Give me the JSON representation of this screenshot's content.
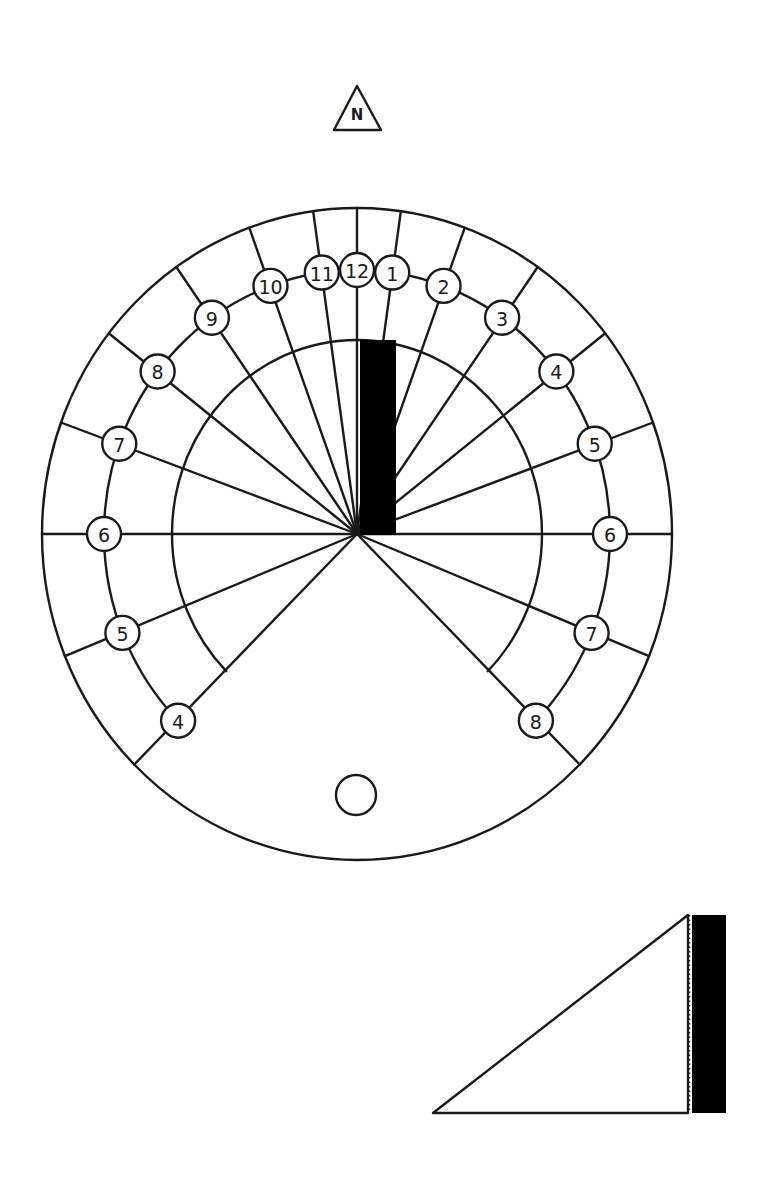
{
  "north_marker": {
    "label": "N",
    "icon": "north-triangle-icon"
  },
  "dial": {
    "center": [
      357,
      534
    ],
    "outer_radius": [
      315,
      326
    ],
    "hour_ring_radius": [
      253,
      264
    ],
    "inner_arc_radius": [
      185,
      194
    ],
    "gnomon_color": "#000000",
    "line_color": "#1a1a1a",
    "hours": [
      {
        "label": "4",
        "angle": -135
      },
      {
        "label": "5",
        "angle": -112
      },
      {
        "label": "6",
        "angle": -90
      },
      {
        "label": "7",
        "angle": -70
      },
      {
        "label": "8",
        "angle": -52
      },
      {
        "label": "9",
        "angle": -35
      },
      {
        "label": "10",
        "angle": -20
      },
      {
        "label": "11",
        "angle": -8
      },
      {
        "label": "12",
        "angle": 0
      },
      {
        "label": "1",
        "angle": 8
      },
      {
        "label": "2",
        "angle": 20
      },
      {
        "label": "3",
        "angle": 35
      },
      {
        "label": "4",
        "angle": 52
      },
      {
        "label": "5",
        "angle": 70
      },
      {
        "label": "6",
        "angle": 90
      },
      {
        "label": "7",
        "angle": 112
      },
      {
        "label": "8",
        "angle": 135
      }
    ],
    "mounting_hole": {
      "center": [
        356,
        795
      ],
      "radius": 20
    }
  },
  "gnomon_side_view": {
    "shape": "right-triangle",
    "points": [
      [
        433,
        1113
      ],
      [
        688,
        915
      ],
      [
        688,
        1113
      ]
    ],
    "fold_strip": {
      "x": 692,
      "y": 915,
      "width": 34,
      "height": 198,
      "color": "#000000"
    },
    "fold_line_style": "dotted"
  }
}
